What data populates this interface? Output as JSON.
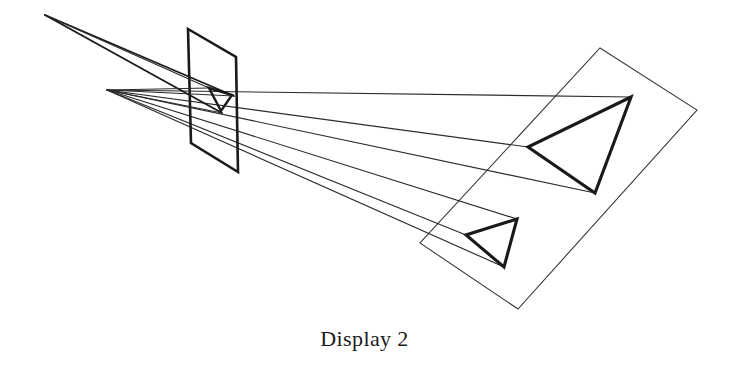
{
  "figure": {
    "caption": "Display 2",
    "background_color": "#ffffff",
    "stroke_color": "#1a1a1a",
    "thin_stroke_color": "#3a3a3a",
    "canvas": {
      "width": 729,
      "height": 365
    }
  },
  "chart_data": {
    "type": "diagram",
    "title": "Display 2",
    "elements": [
      {
        "name": "viewpoint",
        "kind": "point",
        "x": 107,
        "y": 90
      },
      {
        "name": "secondary-viewpoint",
        "kind": "point",
        "x": 45,
        "y": 15
      },
      {
        "name": "near-image-plane",
        "kind": "quad",
        "points": [
          [
            188,
            29
          ],
          [
            236,
            57
          ],
          [
            238,
            172
          ],
          [
            191,
            143
          ]
        ]
      },
      {
        "name": "far-display-plane",
        "kind": "quad",
        "points": [
          [
            600,
            48
          ],
          [
            697,
            110
          ],
          [
            518,
            309
          ],
          [
            420,
            243
          ]
        ]
      },
      {
        "name": "small-triangle-on-image-plane",
        "kind": "triangle",
        "points": [
          [
            209,
            88
          ],
          [
            232,
            95
          ],
          [
            221,
            111
          ]
        ]
      },
      {
        "name": "large-triangle-upper",
        "kind": "triangle",
        "points": [
          [
            631,
            97
          ],
          [
            528,
            147
          ],
          [
            595,
            193
          ]
        ]
      },
      {
        "name": "large-triangle-lower",
        "kind": "triangle",
        "points": [
          [
            517,
            219
          ],
          [
            466,
            235
          ],
          [
            504,
            267
          ]
        ]
      },
      {
        "name": "ray-upper-to-apex",
        "kind": "line",
        "from": [
          107,
          90
        ],
        "to": [
          631,
          97
        ]
      },
      {
        "name": "ray-upper-to-left-vertex",
        "kind": "line",
        "from": [
          107,
          90
        ],
        "to": [
          528,
          147
        ]
      },
      {
        "name": "ray-upper-to-bottom-vertex",
        "kind": "line",
        "from": [
          107,
          90
        ],
        "to": [
          595,
          193
        ]
      },
      {
        "name": "ray-lower-to-apex",
        "kind": "line",
        "from": [
          107,
          90
        ],
        "to": [
          517,
          219
        ]
      },
      {
        "name": "ray-lower-to-left-vertex",
        "kind": "line",
        "from": [
          107,
          90
        ],
        "to": [
          466,
          235
        ]
      },
      {
        "name": "ray-lower-to-bottom-vertex",
        "kind": "line",
        "from": [
          107,
          90
        ],
        "to": [
          504,
          267
        ]
      },
      {
        "name": "sight-line-upper-a",
        "kind": "line",
        "from": [
          45,
          15
        ],
        "to": [
          232,
          95
        ]
      },
      {
        "name": "sight-line-upper-b",
        "kind": "line",
        "from": [
          45,
          15
        ],
        "to": [
          221,
          111
        ]
      },
      {
        "name": "sight-line-upper-c",
        "kind": "line",
        "from": [
          45,
          15
        ],
        "to": [
          209,
          88
        ]
      }
    ]
  }
}
